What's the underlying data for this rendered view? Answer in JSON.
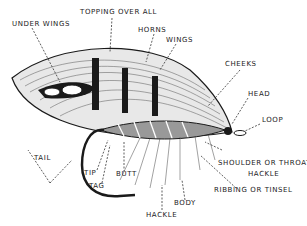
{
  "diagram": {
    "labels": {
      "under_wings": "UNDER WINGS",
      "topping": "TOPPING OVER ALL",
      "horns": "HORNS",
      "wings": "WINGS",
      "cheeks": "CHEEKS",
      "head": "HEAD",
      "loop": "LOOP",
      "tail": "TAIL",
      "tip": "TIP",
      "tag": "TAG",
      "butt": "BUTT",
      "shoulder_1": "SHOULDER OR THROAT",
      "shoulder_2": "HACKLE",
      "ribbing": "RIBBING OR TINSEL",
      "body": "BODY",
      "hackle": "HACKLE"
    },
    "colors": {
      "ink": "#1a1a1a",
      "paper": "#ffffff"
    }
  }
}
